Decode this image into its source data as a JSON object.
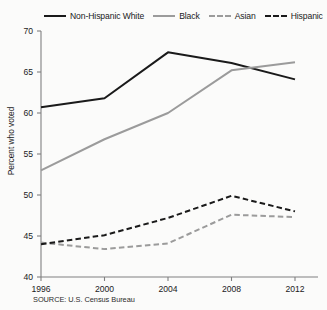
{
  "chart_data": {
    "type": "line",
    "title": "",
    "xlabel": "",
    "ylabel": "Percent who voted",
    "x": [
      1996,
      2000,
      2004,
      2008,
      2012
    ],
    "xticklabels": [
      "1996",
      "2000",
      "2004",
      "2008",
      "2012"
    ],
    "yticklabels": [
      "40",
      "45",
      "50",
      "55",
      "60",
      "65",
      "70"
    ],
    "yticks": [
      40,
      45,
      50,
      55,
      60,
      65,
      70
    ],
    "ylim": [
      40,
      70
    ],
    "xlim": [
      1996,
      2012
    ],
    "grid": false,
    "legend_position": "top",
    "series": [
      {
        "name": "Non-Hispanic White",
        "values": [
          60.7,
          61.8,
          67.4,
          66.1,
          64.1
        ],
        "color": "#1a1a1a",
        "style": "solid"
      },
      {
        "name": "Black",
        "values": [
          53.0,
          56.8,
          60.0,
          65.2,
          66.2
        ],
        "color": "#9b9b9b",
        "style": "solid"
      },
      {
        "name": "Asian",
        "values": [
          44.2,
          43.4,
          44.1,
          47.6,
          47.3
        ],
        "color": "#9b9b9b",
        "style": "dashed"
      },
      {
        "name": "Hispanic",
        "values": [
          44.0,
          45.1,
          47.2,
          49.9,
          48.0
        ],
        "color": "#1a1a1a",
        "style": "dashed"
      }
    ],
    "source": "SOURCE: U.S. Census Bureau"
  },
  "colors": {
    "dark_line": "#1a1a1a",
    "gray_line": "#9b9b9b",
    "axis": "#808080",
    "background": "#fbfbfa",
    "text": "#1a1a1a"
  }
}
